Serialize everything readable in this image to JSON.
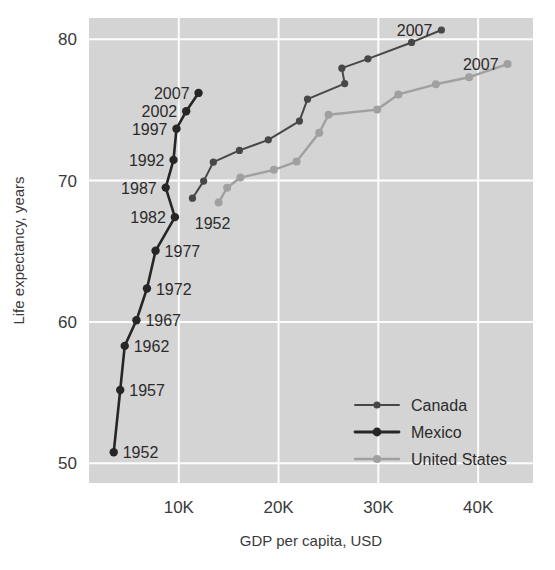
{
  "chart_data": {
    "type": "line",
    "title": "",
    "xlabel": "GDP per capita, USD",
    "ylabel": "Life expectancy, years",
    "xlim": [
      1000,
      45500
    ],
    "ylim": [
      48.6,
      81.5
    ],
    "xticks": [
      10000,
      20000,
      30000,
      40000
    ],
    "xticklabels": [
      "10K",
      "20K",
      "30K",
      "40K"
    ],
    "yticks": [
      50,
      60,
      70,
      80
    ],
    "yticklabels": [
      "50",
      "60",
      "70",
      "80"
    ],
    "grid": true,
    "legend_position": "bottom-right",
    "plot_bg": "#d4d4d4",
    "grid_color": "#fdfdfd",
    "series": [
      {
        "name": "Canada",
        "color": "#474747",
        "line_width": 2.0,
        "marker_size": 3.6,
        "points": [
          {
            "year": 1952,
            "x": 11367,
            "y": 68.75
          },
          {
            "year": 1957,
            "x": 12490,
            "y": 69.96
          },
          {
            "year": 1962,
            "x": 13462,
            "y": 71.3
          },
          {
            "year": 1967,
            "x": 16076,
            "y": 72.13
          },
          {
            "year": 1972,
            "x": 18970,
            "y": 72.88
          },
          {
            "year": 1977,
            "x": 22091,
            "y": 74.21
          },
          {
            "year": 1982,
            "x": 22899,
            "y": 75.76
          },
          {
            "year": 1987,
            "x": 26626,
            "y": 76.86
          },
          {
            "year": 1992,
            "x": 26343,
            "y": 77.95
          },
          {
            "year": 1997,
            "x": 28955,
            "y": 78.61
          },
          {
            "year": 2002,
            "x": 33329,
            "y": 79.77
          },
          {
            "year": 2007,
            "x": 36319,
            "y": 80.65
          }
        ],
        "end_label": {
          "year": 2007,
          "text": "2007"
        }
      },
      {
        "name": "Mexico",
        "color": "#262626",
        "line_width": 2.6,
        "marker_size": 4.2,
        "points": [
          {
            "year": 1952,
            "x": 3478,
            "y": 50.78
          },
          {
            "year": 1957,
            "x": 4131,
            "y": 55.18
          },
          {
            "year": 1962,
            "x": 4581,
            "y": 58.3
          },
          {
            "year": 1967,
            "x": 5754,
            "y": 60.11
          },
          {
            "year": 1972,
            "x": 6809,
            "y": 62.36
          },
          {
            "year": 1977,
            "x": 7674,
            "y": 65.03
          },
          {
            "year": 1982,
            "x": 9611,
            "y": 67.41
          },
          {
            "year": 1987,
            "x": 8688,
            "y": 69.5
          },
          {
            "year": 1992,
            "x": 9472,
            "y": 71.46
          },
          {
            "year": 1997,
            "x": 9767,
            "y": 73.67
          },
          {
            "year": 2002,
            "x": 10742,
            "y": 74.9
          },
          {
            "year": 2007,
            "x": 11978,
            "y": 76.2
          }
        ],
        "labeled_points": [
          {
            "year": 1952,
            "text": "1952",
            "side": "right"
          },
          {
            "year": 1957,
            "text": "1957",
            "side": "right"
          },
          {
            "year": 1962,
            "text": "1962",
            "side": "right"
          },
          {
            "year": 1967,
            "text": "1967",
            "side": "right"
          },
          {
            "year": 1972,
            "text": "1972",
            "side": "right"
          },
          {
            "year": 1977,
            "text": "1977",
            "side": "right"
          },
          {
            "year": 1982,
            "text": "1982",
            "side": "left"
          },
          {
            "year": 1987,
            "text": "1987",
            "side": "left"
          },
          {
            "year": 1992,
            "text": "1992",
            "side": "left"
          },
          {
            "year": 1997,
            "text": "1997",
            "side": "left"
          },
          {
            "year": 2002,
            "text": "2002",
            "side": "left"
          },
          {
            "year": 2007,
            "text": "2007",
            "side": "left"
          }
        ]
      },
      {
        "name": "United States",
        "color": "#a0a0a0",
        "line_width": 2.4,
        "marker_size": 4.0,
        "points": [
          {
            "year": 1952,
            "x": 13990,
            "y": 68.44
          },
          {
            "year": 1957,
            "x": 14847,
            "y": 69.49
          },
          {
            "year": 1962,
            "x": 16173,
            "y": 70.21
          },
          {
            "year": 1967,
            "x": 19530,
            "y": 70.76
          },
          {
            "year": 1972,
            "x": 21806,
            "y": 71.34
          },
          {
            "year": 1977,
            "x": 24073,
            "y": 73.38
          },
          {
            "year": 1982,
            "x": 25010,
            "y": 74.65
          },
          {
            "year": 1987,
            "x": 29884,
            "y": 75.02
          },
          {
            "year": 1992,
            "x": 32004,
            "y": 76.09
          },
          {
            "year": 1997,
            "x": 35767,
            "y": 76.81
          },
          {
            "year": 2002,
            "x": 39097,
            "y": 77.31
          },
          {
            "year": 2007,
            "x": 42952,
            "y": 78.24
          }
        ],
        "end_label": {
          "year": 2007,
          "text": "2007"
        },
        "start_label": {
          "year": 1952,
          "text": "1952"
        }
      }
    ],
    "legend_entries": [
      {
        "label": "Canada",
        "color": "#474747",
        "line_width": 2.0,
        "marker_size": 3.6
      },
      {
        "label": "Mexico",
        "color": "#262626",
        "line_width": 2.8,
        "marker_size": 4.4
      },
      {
        "label": "United States",
        "color": "#a0a0a0",
        "line_width": 2.4,
        "marker_size": 4.0
      }
    ]
  }
}
